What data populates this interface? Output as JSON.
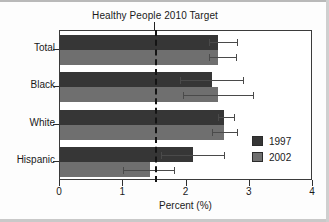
{
  "chart_data": {
    "type": "bar",
    "orientation": "horizontal",
    "title": "Healthy People 2010 Target",
    "xlabel": "Percent (%)",
    "ylabel": "",
    "categories": [
      "Total",
      "Black",
      "White",
      "Hispanic"
    ],
    "series": [
      {
        "name": "1997",
        "color": "#363636",
        "values": [
          2.5,
          2.4,
          2.6,
          2.1
        ],
        "error_low": [
          2.35,
          1.9,
          2.5,
          1.6
        ],
        "error_high": [
          2.8,
          2.9,
          2.75,
          2.6
        ]
      },
      {
        "name": "2002",
        "color": "#6f6f6f",
        "values": [
          2.5,
          2.5,
          2.6,
          1.43
        ],
        "error_low": [
          2.35,
          1.95,
          2.4,
          1.0
        ],
        "error_high": [
          2.78,
          3.05,
          2.8,
          1.8
        ]
      }
    ],
    "xlim": [
      0,
      4
    ],
    "xticks": [
      0,
      1,
      2,
      3,
      4
    ],
    "xticklabels": [
      "0",
      "1",
      "2",
      "3",
      "4"
    ],
    "grid": false,
    "legend_position": "bottom-right",
    "annotations": [
      {
        "name": "healthy-people-2010-target-line",
        "type": "vline",
        "value": 1.5,
        "label": "Healthy People 2010 Target",
        "style": "dashed"
      }
    ]
  },
  "legend": {
    "entries": [
      {
        "label": "1997",
        "color": "#363636"
      },
      {
        "label": "2002",
        "color": "#6f6f6f"
      }
    ]
  }
}
